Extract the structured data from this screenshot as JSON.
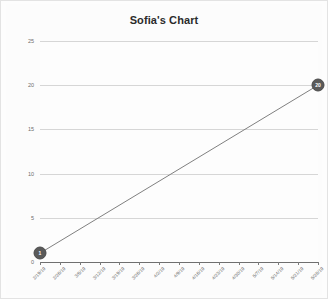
{
  "chart_data": {
    "type": "line",
    "title": "Sofia's Chart",
    "xlabel": "",
    "ylabel": "",
    "ylim": [
      0,
      25
    ],
    "yticks": [
      0,
      5,
      10,
      15,
      20,
      25
    ],
    "grid": true,
    "legend": false,
    "legend_position": "none",
    "categories": [
      "2/19/19",
      "2/26/19",
      "3/5/19",
      "3/12/19",
      "3/19/19",
      "3/26/19",
      "4/2/19",
      "4/9/19",
      "4/16/19",
      "4/23/19",
      "4/30/19",
      "5/7/19",
      "5/14/19",
      "5/21/19",
      "5/28/19"
    ],
    "series": [
      {
        "name": "Series 1",
        "values": [
          1,
          null,
          null,
          null,
          null,
          null,
          null,
          null,
          null,
          null,
          null,
          null,
          null,
          null,
          20
        ]
      }
    ],
    "data_labels": [
      {
        "category": "2/19/19",
        "value": 1,
        "text": "1"
      },
      {
        "category": "5/28/19",
        "value": 20,
        "text": "20"
      }
    ],
    "colors": {
      "line": "#808080",
      "marker": "#5a5a5a",
      "marker_label": "#ffffff",
      "gridline": "#d6d6d6",
      "axis": "#6f6f6f",
      "title": "#2b2b2b",
      "tick_label": "#6a6a6a",
      "background": "#fcfcfc"
    }
  }
}
